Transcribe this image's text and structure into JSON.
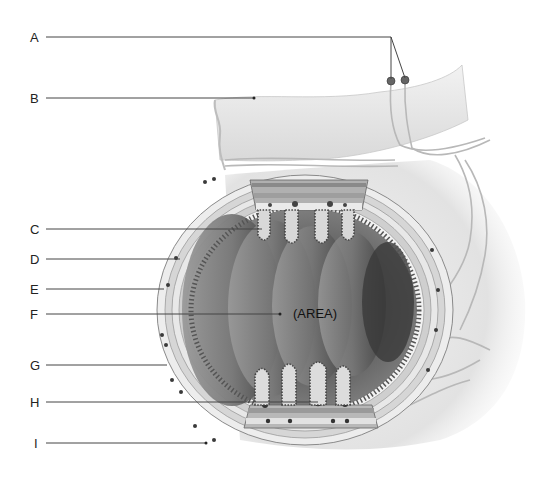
{
  "diagram": {
    "labels": [
      {
        "id": "A",
        "text": "A",
        "x": 32,
        "y": 38
      },
      {
        "id": "B",
        "text": "B",
        "x": 32,
        "y": 98
      },
      {
        "id": "C",
        "text": "C",
        "x": 32,
        "y": 230
      },
      {
        "id": "D",
        "text": "D",
        "x": 32,
        "y": 260
      },
      {
        "id": "E",
        "text": "E",
        "x": 32,
        "y": 289
      },
      {
        "id": "F",
        "text": "F",
        "x": 32,
        "y": 314
      },
      {
        "id": "G",
        "text": "G",
        "x": 32,
        "y": 365
      },
      {
        "id": "H",
        "text": "H",
        "x": 32,
        "y": 402
      },
      {
        "id": "I",
        "text": "I",
        "x": 34,
        "y": 443
      }
    ],
    "area_label": "(AREA)",
    "colors": {
      "leader_line": "#444444",
      "tissue_light": "#e6e6e6",
      "tissue_mid": "#a8a8a8",
      "tissue_dark": "#4a4a4a",
      "background": "#ffffff"
    }
  }
}
